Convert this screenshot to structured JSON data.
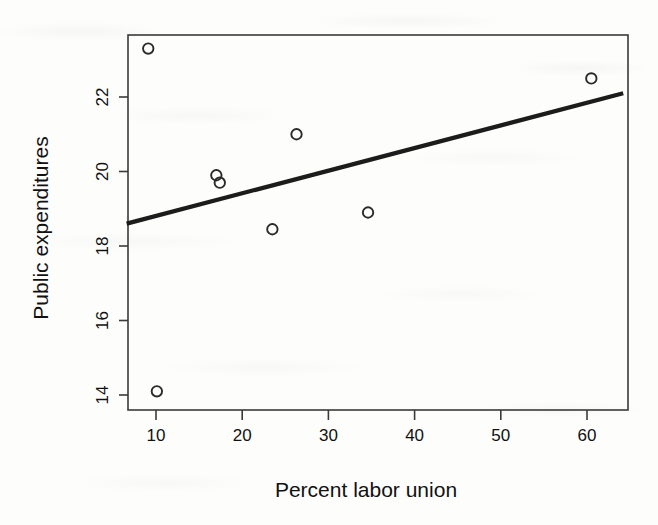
{
  "chart_data": {
    "type": "scatter",
    "title": "",
    "xlabel": "Percent labor union",
    "ylabel": "Public expenditures",
    "xlim": [
      6.6,
      64.2
    ],
    "ylim": [
      13.3,
      24.1
    ],
    "grid": false,
    "legend": "none",
    "xticks": [
      10,
      20,
      30,
      40,
      50,
      60
    ],
    "xtick_labels": [
      "10",
      "20",
      "30",
      "40",
      "50",
      "60"
    ],
    "yticks": [
      14,
      16,
      18,
      20,
      22
    ],
    "ytick_labels": [
      "14",
      "16",
      "18",
      "20",
      "22"
    ],
    "points": [
      {
        "x": 9.1,
        "y": 23.3
      },
      {
        "x": 10.1,
        "y": 14.1
      },
      {
        "x": 17.0,
        "y": 19.9
      },
      {
        "x": 17.4,
        "y": 19.7
      },
      {
        "x": 23.5,
        "y": 18.45
      },
      {
        "x": 26.3,
        "y": 21.0
      },
      {
        "x": 34.6,
        "y": 18.9
      },
      {
        "x": 60.5,
        "y": 22.5
      }
    ],
    "series": [
      {
        "name": "observations",
        "marker": "open-circle",
        "x": [
          9.1,
          10.1,
          17.0,
          17.4,
          23.5,
          26.3,
          34.6,
          60.5
        ],
        "values": [
          23.3,
          14.1,
          19.9,
          19.7,
          18.45,
          21.0,
          18.9,
          22.5
        ]
      }
    ],
    "fit_line": {
      "name": "least-squares regression line",
      "x_start": 6.6,
      "y_start": 18.6,
      "x_end": 64.2,
      "y_end": 22.1,
      "slope": 0.0608,
      "intercept": 18.2
    }
  },
  "axes": {
    "x_title": "Percent labor union",
    "y_title": "Public expenditures"
  }
}
